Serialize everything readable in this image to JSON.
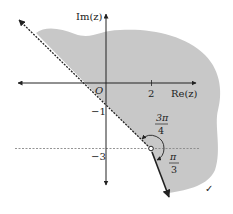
{
  "diagram": {
    "type": "argand-diagram",
    "axes": {
      "x_label": "Re(z)",
      "y_label": "Im(z)",
      "origin_label": "O"
    },
    "ticks": {
      "x": [
        {
          "value": 2,
          "label": "2"
        }
      ],
      "y": [
        {
          "value": -1,
          "label": "−1"
        },
        {
          "value": -3,
          "label": "−3"
        }
      ]
    },
    "vertex": {
      "re": 2,
      "im": -3,
      "style": "open-circle"
    },
    "rays": [
      {
        "name": "dashed-ray",
        "angle_label_num": "3π",
        "angle_label_den": "4",
        "style": "dashed"
      },
      {
        "name": "solid-ray",
        "angle_label_num": "π",
        "angle_label_den": "3",
        "style": "solid"
      }
    ],
    "reference_line": {
      "im": -3,
      "style": "dashed-horizontal"
    },
    "shaded_region": {
      "color": "#c8c8c8"
    },
    "checkmark": "✓",
    "colors": {
      "shade": "#c8c8c8",
      "ink": "#222222",
      "dash": "#888888"
    }
  }
}
